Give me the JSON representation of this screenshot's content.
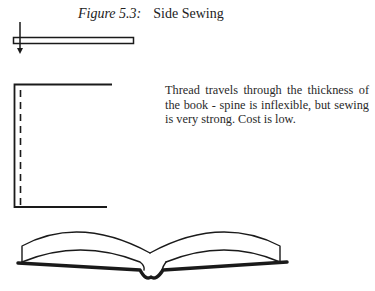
{
  "figure": {
    "label": "Figure 5.3:",
    "title": "Side Sewing",
    "description": "Thread travels through the thickness of the book - spine is inflexible, but sewing is very strong. Cost is low."
  },
  "diagrams": [
    {
      "name": "top-view-book-with-thread-arrow"
    },
    {
      "name": "side-view-book-with-stitch-line"
    },
    {
      "name": "open-book-illustration"
    }
  ],
  "colors": {
    "ink": "#1a1a1a",
    "background": "#ffffff"
  }
}
